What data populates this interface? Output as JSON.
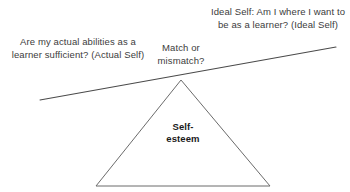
{
  "diagram": {
    "labels": {
      "actual_self": "Are my actual abilities as a learner sufficient? (Actual Self)",
      "ideal_self": "Ideal Self: Am I where I want to be as a learner? (Ideal Self)",
      "match": "Match or mismatch?",
      "fulcrum": "Self-\nesteem"
    },
    "shapes": {
      "beam": {
        "name": "tilted-balance-beam",
        "x1": 40,
        "y1": 100,
        "x2": 336,
        "y2": 47,
        "color": "#4a4a4a",
        "width": 1.1
      },
      "triangle": {
        "name": "fulcrum-triangle",
        "apex_x": 181,
        "apex_y": 80,
        "left_x": 96,
        "left_y": 186,
        "right_x": 270,
        "right_y": 186,
        "stroke": "#6b6b6b",
        "fill": "#ffffff",
        "width": 1
      }
    },
    "colors": {
      "background": "#ffffff",
      "text": "#3c3c3c",
      "bold_text": "#1a1a1a",
      "line": "#4a4a4a"
    }
  }
}
